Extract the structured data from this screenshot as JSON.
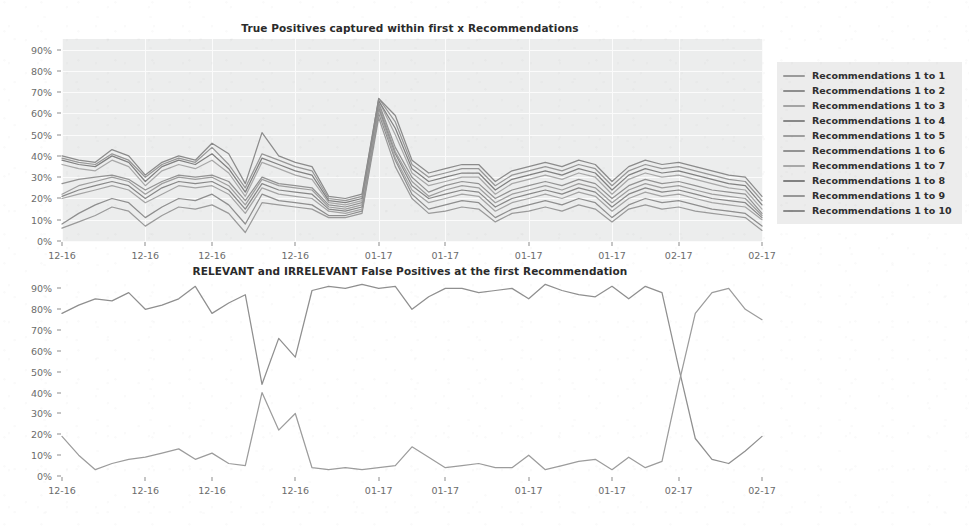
{
  "figure": {
    "background_color": "#ffffff",
    "plot_background_color": "#eceded",
    "gridline_color": "#fbfbfb",
    "tick_label_color": "#6b6b6b",
    "rendering": "grayscale scanned document"
  },
  "charts": [
    {
      "id": "true-positives",
      "chart_data": {
        "type": "line",
        "title": "True Positives captured within first x Recommendations",
        "xlabel": "",
        "ylabel": "",
        "ylim": [
          0,
          95
        ],
        "grid": true,
        "legend_position": "right",
        "yticks": [
          "0%",
          "10%",
          "20%",
          "30%",
          "40%",
          "50%",
          "60%",
          "70%",
          "80%",
          "90%"
        ],
        "ytick_values": [
          0,
          10,
          20,
          30,
          40,
          50,
          60,
          70,
          80,
          90
        ],
        "xticks": [
          "12-16",
          "12-16",
          "12-16",
          "12-16",
          "01-17",
          "01-17",
          "01-17",
          "01-17",
          "02-17",
          "02-17"
        ],
        "x": [
          0,
          1,
          2,
          3,
          4,
          5,
          6,
          7,
          8,
          9,
          10,
          11,
          12,
          13,
          14,
          15,
          16,
          17,
          18,
          19,
          20,
          21,
          22,
          23,
          24,
          25,
          26,
          27,
          28,
          29,
          30,
          31,
          32,
          33,
          34,
          35,
          36,
          37,
          38,
          39,
          40,
          41,
          42
        ],
        "series": [
          {
            "name": "Recommendations 1 to 1",
            "color": "#9a9a9a",
            "values": [
              6,
              9,
              12,
              16,
              14,
              7,
              12,
              16,
              15,
              17,
              13,
              4,
              18,
              17,
              16,
              15,
              11,
              11,
              13,
              58,
              35,
              20,
              13,
              14,
              16,
              15,
              9,
              13,
              14,
              16,
              14,
              17,
              15,
              9,
              15,
              17,
              15,
              16,
              14,
              13,
              12,
              11,
              5
            ]
          },
          {
            "name": "Recommendations 1 to 2",
            "color": "#8e8e8e",
            "values": [
              8,
              13,
              17,
              20,
              18,
              11,
              16,
              20,
              19,
              22,
              17,
              8,
              22,
              19,
              18,
              17,
              12,
              12,
              14,
              60,
              38,
              22,
              15,
              17,
              19,
              18,
              11,
              15,
              17,
              19,
              17,
              20,
              18,
              11,
              17,
              20,
              18,
              19,
              17,
              15,
              14,
              13,
              7
            ]
          },
          {
            "name": "Recommendations 1 to 3",
            "color": "#a4a4a4",
            "values": [
              20,
              22,
              24,
              26,
              24,
              18,
              22,
              26,
              25,
              26,
              22,
              13,
              25,
              22,
              21,
              20,
              14,
              13,
              15,
              62,
              39,
              24,
              18,
              20,
              22,
              21,
              14,
              18,
              20,
              22,
              20,
              23,
              21,
              14,
              20,
              23,
              21,
              22,
              20,
              18,
              17,
              16,
              10
            ]
          },
          {
            "name": "Recommendations 1 to 4",
            "color": "#888888",
            "values": [
              21,
              24,
              26,
              28,
              26,
              20,
              25,
              28,
              27,
              28,
              24,
              15,
              27,
              24,
              23,
              22,
              15,
              14,
              16,
              63,
              41,
              26,
              20,
              22,
              24,
              23,
              16,
              20,
              22,
              24,
              22,
              25,
              23,
              16,
              22,
              25,
              23,
              24,
              22,
              20,
              19,
              18,
              11
            ]
          },
          {
            "name": "Recommendations 1 to 5",
            "color": "#9e9e9e",
            "values": [
              22,
              26,
              28,
              30,
              28,
              22,
              27,
              30,
              29,
              30,
              26,
              17,
              29,
              26,
              25,
              24,
              16,
              15,
              17,
              64,
              42,
              28,
              21,
              24,
              26,
              25,
              18,
              22,
              24,
              26,
              24,
              27,
              25,
              18,
              24,
              27,
              25,
              26,
              24,
              22,
              21,
              20,
              12
            ]
          },
          {
            "name": "Recommendations 1 to 6",
            "color": "#939393",
            "values": [
              27,
              29,
              30,
              31,
              29,
              24,
              28,
              31,
              30,
              31,
              28,
              19,
              30,
              27,
              26,
              25,
              17,
              16,
              18,
              65,
              44,
              30,
              23,
              26,
              28,
              27,
              20,
              24,
              26,
              28,
              26,
              29,
              27,
              20,
              26,
              29,
              27,
              28,
              26,
              24,
              23,
              22,
              13
            ]
          },
          {
            "name": "Recommendations 1 to 7",
            "color": "#a8a8a8",
            "values": [
              36,
              34,
              33,
              38,
              35,
              26,
              33,
              36,
              34,
              38,
              32,
              21,
              37,
              34,
              31,
              29,
              18,
              17,
              19,
              66,
              50,
              32,
              26,
              28,
              30,
              30,
              22,
              27,
              29,
              31,
              29,
              32,
              30,
              22,
              29,
              32,
              30,
              31,
              29,
              27,
              25,
              24,
              15
            ]
          },
          {
            "name": "Recommendations 1 to 8",
            "color": "#818181",
            "values": [
              38,
              36,
              35,
              40,
              37,
              28,
              35,
              38,
              36,
              41,
              34,
              23,
              39,
              36,
              33,
              31,
              19,
              18,
              20,
              66,
              53,
              34,
              28,
              30,
              32,
              32,
              24,
              29,
              31,
              33,
              31,
              34,
              32,
              24,
              31,
              34,
              32,
              33,
              31,
              29,
              27,
              26,
              17
            ]
          },
          {
            "name": "Recommendations 1 to 9",
            "color": "#979797",
            "values": [
              39,
              37,
              36,
              41,
              38,
              30,
              36,
              39,
              37,
              44,
              36,
              25,
              41,
              38,
              35,
              33,
              20,
              19,
              21,
              67,
              56,
              36,
              30,
              32,
              34,
              34,
              26,
              31,
              33,
              35,
              33,
              36,
              34,
              26,
              33,
              36,
              34,
              35,
              33,
              31,
              29,
              28,
              19
            ]
          },
          {
            "name": "Recommendations 1 to 10",
            "color": "#8b8b8b",
            "values": [
              40,
              38,
              37,
              43,
              40,
              31,
              37,
              40,
              38,
              46,
              41,
              27,
              51,
              40,
              37,
              35,
              21,
              20,
              22,
              67,
              59,
              38,
              32,
              34,
              36,
              36,
              28,
              33,
              35,
              37,
              35,
              38,
              36,
              28,
              35,
              38,
              36,
              37,
              35,
              33,
              31,
              30,
              21
            ]
          }
        ]
      }
    },
    {
      "id": "false-positives",
      "chart_data": {
        "type": "line",
        "title": "RELEVANT and IRRELEVANT False Positives at the first Recommendation",
        "xlabel": "",
        "ylabel": "",
        "ylim": [
          0,
          95
        ],
        "grid": true,
        "legend_position": "right",
        "yticks": [
          "0%",
          "10%",
          "20%",
          "30%",
          "40%",
          "50%",
          "60%",
          "70%",
          "80%",
          "90%"
        ],
        "ytick_values": [
          0,
          10,
          20,
          30,
          40,
          50,
          60,
          70,
          80,
          90
        ],
        "xticks": [
          "12-16",
          "12-16",
          "12-16",
          "12-16",
          "01-17",
          "01-17",
          "01-17",
          "01-17",
          "02-17",
          "02-17"
        ],
        "x": [
          0,
          1,
          2,
          3,
          4,
          5,
          6,
          7,
          8,
          9,
          10,
          11,
          12,
          13,
          14,
          15,
          16,
          17,
          18,
          19,
          20,
          21,
          22,
          23,
          24,
          25,
          26,
          27,
          28,
          29,
          30,
          31,
          32,
          33,
          34,
          35,
          36,
          37,
          38,
          39,
          40,
          41,
          42
        ],
        "series": [
          {
            "name": "Relevant",
            "color": "#8f8f8f",
            "values": [
              78,
              82,
              85,
              84,
              88,
              80,
              82,
              85,
              91,
              78,
              83,
              87,
              44,
              66,
              57,
              89,
              91,
              90,
              92,
              90,
              91,
              80,
              86,
              90,
              90,
              88,
              89,
              90,
              85,
              92,
              89,
              87,
              86,
              91,
              85,
              91,
              88,
              52,
              18,
              8,
              6,
              12,
              19
            ]
          },
          {
            "name": "Irrelevant",
            "color": "#9c9c9c",
            "values": [
              19,
              10,
              3,
              6,
              8,
              9,
              11,
              13,
              8,
              11,
              6,
              5,
              40,
              22,
              30,
              4,
              3,
              4,
              3,
              4,
              5,
              14,
              9,
              4,
              5,
              6,
              4,
              4,
              10,
              3,
              5,
              7,
              8,
              3,
              9,
              4,
              7,
              44,
              78,
              88,
              90,
              80,
              75
            ]
          }
        ]
      }
    }
  ]
}
